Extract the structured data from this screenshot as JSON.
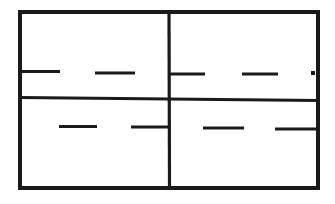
{
  "canvas": {
    "width": 335,
    "height": 204,
    "background": "#ffffff",
    "line_color": "#1a1a1a"
  },
  "diagram": {
    "elements": [
      {
        "name": "outer-frame",
        "type": "rect",
        "attrs": {
          "x": 20,
          "y": 12,
          "width": 298,
          "height": 176,
          "fill": "none",
          "stroke": "#1a1a1a",
          "stroke-width": 4
        }
      },
      {
        "name": "vertical-divider",
        "type": "line",
        "attrs": {
          "x1": 169,
          "y1": 12,
          "x2": 169.5,
          "y2": 188,
          "stroke": "#1a1a1a",
          "stroke-width": 3.2
        }
      },
      {
        "name": "horizontal-center-line",
        "type": "line",
        "attrs": {
          "x1": 19,
          "y1": 97.5,
          "x2": 319,
          "y2": 100.5,
          "stroke": "#1a1a1a",
          "stroke-width": 3
        }
      },
      {
        "name": "dash-upper-left-1",
        "type": "line",
        "attrs": {
          "x1": 19,
          "y1": 71.5,
          "x2": 60,
          "y2": 71.5,
          "stroke": "#1a1a1a",
          "stroke-width": 3.2
        }
      },
      {
        "name": "dash-upper-left-2",
        "type": "line",
        "attrs": {
          "x1": 95,
          "y1": 73,
          "x2": 135,
          "y2": 73,
          "stroke": "#1a1a1a",
          "stroke-width": 3.2
        }
      },
      {
        "name": "dash-upper-right-1",
        "type": "line",
        "attrs": {
          "x1": 169,
          "y1": 74,
          "x2": 205,
          "y2": 74,
          "stroke": "#1a1a1a",
          "stroke-width": 3.2
        }
      },
      {
        "name": "dash-upper-right-2",
        "type": "line",
        "attrs": {
          "x1": 242,
          "y1": 74,
          "x2": 278,
          "y2": 74,
          "stroke": "#1a1a1a",
          "stroke-width": 3.2
        }
      },
      {
        "name": "dot-upper-right",
        "type": "rect",
        "attrs": {
          "x": 311,
          "y": 71,
          "width": 4,
          "height": 4,
          "fill": "#1a1a1a",
          "stroke": "none"
        }
      },
      {
        "name": "dash-lower-left-1",
        "type": "line",
        "attrs": {
          "x1": 59,
          "y1": 126.5,
          "x2": 97,
          "y2": 126.5,
          "stroke": "#1a1a1a",
          "stroke-width": 3.2
        }
      },
      {
        "name": "dash-lower-left-2",
        "type": "line",
        "attrs": {
          "x1": 131,
          "y1": 127,
          "x2": 169,
          "y2": 127,
          "stroke": "#1a1a1a",
          "stroke-width": 3.2
        }
      },
      {
        "name": "dash-lower-right-1",
        "type": "line",
        "attrs": {
          "x1": 203,
          "y1": 128,
          "x2": 244,
          "y2": 128,
          "stroke": "#1a1a1a",
          "stroke-width": 3.2
        }
      },
      {
        "name": "dash-lower-right-2",
        "type": "line",
        "attrs": {
          "x1": 275,
          "y1": 129,
          "x2": 319,
          "y2": 129,
          "stroke": "#1a1a1a",
          "stroke-width": 3.2
        }
      }
    ]
  }
}
